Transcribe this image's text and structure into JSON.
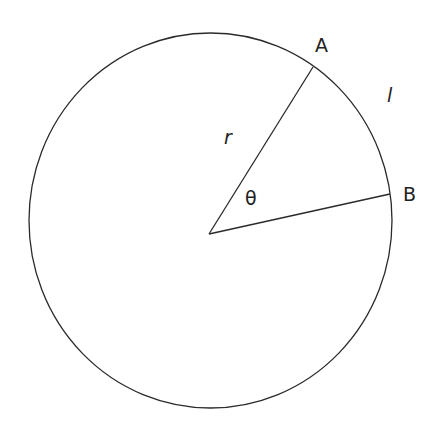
{
  "diagram": {
    "type": "circle-sector",
    "labels": {
      "point_a": "A",
      "point_b": "B",
      "radius": "r",
      "arc_length": "l",
      "angle": "θ"
    },
    "colors": {
      "stroke": "#2a2a2a",
      "background": "#ffffff"
    }
  }
}
